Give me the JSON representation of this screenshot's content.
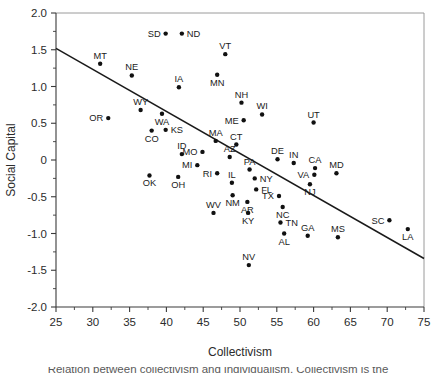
{
  "figure": {
    "background": "#ffffff",
    "dot_color": "#111111",
    "line_color": "#1a1a1a",
    "axis_color": "#3a3a3a",
    "frame_color": "#8e8e8e"
  },
  "caption": {
    "partial_text": "Relation between collectivism and individualism. Collectivism is the"
  },
  "chart_data": {
    "type": "scatter",
    "title": "",
    "xlabel": "Collectivism",
    "ylabel": "Social Capital",
    "xlim": [
      25,
      75
    ],
    "ylim": [
      -2.0,
      2.0
    ],
    "xticks": [
      25,
      30,
      35,
      40,
      45,
      50,
      55,
      60,
      65,
      70,
      75
    ],
    "xtick_labels": [
      "25",
      "30",
      "35",
      "40",
      "45",
      "50",
      "55",
      "60",
      "65",
      "70",
      "75"
    ],
    "yticks": [
      -2.0,
      -1.5,
      -1.0,
      -0.5,
      0,
      0.5,
      1.0,
      1.5,
      2.0
    ],
    "ytick_labels": [
      "-2.0",
      "-1.5",
      "-1.0",
      "-0.5",
      "0",
      "0.5",
      "1.0",
      "1.5",
      "2.0"
    ],
    "xminor_step": 2.5,
    "yminor_step": 0.25,
    "grid": false,
    "legend": "none",
    "point_label_field": "state",
    "trend_line": {
      "x_start": 25,
      "y_start": 1.52,
      "x_end": 75,
      "y_end": -1.34
    },
    "points": [
      {
        "state": "SD",
        "x": 39.9,
        "y": 1.72,
        "label_pos": "left"
      },
      {
        "state": "ND",
        "x": 42.1,
        "y": 1.72,
        "label_pos": "right"
      },
      {
        "state": "VT",
        "x": 48.0,
        "y": 1.44,
        "label_pos": "top"
      },
      {
        "state": "MT",
        "x": 31.0,
        "y": 1.31,
        "label_pos": "top"
      },
      {
        "state": "MN",
        "x": 46.9,
        "y": 1.16,
        "label_pos": "bottom"
      },
      {
        "state": "NE",
        "x": 35.3,
        "y": 1.15,
        "label_pos": "top"
      },
      {
        "state": "IA",
        "x": 41.7,
        "y": 0.99,
        "label_pos": "top"
      },
      {
        "state": "NH",
        "x": 50.2,
        "y": 0.78,
        "label_pos": "top"
      },
      {
        "state": "WY",
        "x": 36.5,
        "y": 0.68,
        "label_pos": "top"
      },
      {
        "state": "WI",
        "x": 53.0,
        "y": 0.62,
        "label_pos": "top"
      },
      {
        "state": "WA",
        "x": 39.4,
        "y": 0.63,
        "label_pos": "bottom"
      },
      {
        "state": "OR",
        "x": 32.1,
        "y": 0.57,
        "label_pos": "left"
      },
      {
        "state": "ME",
        "x": 50.5,
        "y": 0.54,
        "label_pos": "left"
      },
      {
        "state": "UT",
        "x": 60.0,
        "y": 0.51,
        "label_pos": "top"
      },
      {
        "state": "KS",
        "x": 39.9,
        "y": 0.41,
        "label_pos": "right"
      },
      {
        "state": "CO",
        "x": 38.0,
        "y": 0.4,
        "label_pos": "bottom"
      },
      {
        "state": "MA",
        "x": 46.7,
        "y": 0.26,
        "label_pos": "top"
      },
      {
        "state": "CT",
        "x": 49.5,
        "y": 0.21,
        "label_pos": "top"
      },
      {
        "state": "MO",
        "x": 44.9,
        "y": 0.11,
        "label_pos": "left"
      },
      {
        "state": "ID",
        "x": 42.1,
        "y": 0.08,
        "label_pos": "top"
      },
      {
        "state": "AZ",
        "x": 48.6,
        "y": 0.04,
        "label_pos": "top"
      },
      {
        "state": "DE",
        "x": 55.1,
        "y": 0.01,
        "label_pos": "top"
      },
      {
        "state": "MI",
        "x": 44.2,
        "y": -0.07,
        "label_pos": "left"
      },
      {
        "state": "IN",
        "x": 57.3,
        "y": -0.04,
        "label_pos": "top"
      },
      {
        "state": "CA",
        "x": 60.2,
        "y": -0.11,
        "label_pos": "top"
      },
      {
        "state": "PA",
        "x": 51.3,
        "y": -0.13,
        "label_pos": "top"
      },
      {
        "state": "MD",
        "x": 63.1,
        "y": -0.18,
        "label_pos": "top"
      },
      {
        "state": "RI",
        "x": 46.9,
        "y": -0.18,
        "label_pos": "left"
      },
      {
        "state": "VA",
        "x": 60.1,
        "y": -0.2,
        "label_pos": "left"
      },
      {
        "state": "OK",
        "x": 37.7,
        "y": -0.21,
        "label_pos": "bottom"
      },
      {
        "state": "OH",
        "x": 41.6,
        "y": -0.23,
        "label_pos": "bottom"
      },
      {
        "state": "NY",
        "x": 52.0,
        "y": -0.25,
        "label_pos": "right"
      },
      {
        "state": "IL",
        "x": 48.9,
        "y": -0.31,
        "label_pos": "top"
      },
      {
        "state": "NJ",
        "x": 59.5,
        "y": -0.33,
        "label_pos": "bottom"
      },
      {
        "state": "FL",
        "x": 52.2,
        "y": -0.4,
        "label_pos": "right"
      },
      {
        "state": "NM",
        "x": 49.0,
        "y": -0.48,
        "label_pos": "bottom"
      },
      {
        "state": "TX",
        "x": 55.3,
        "y": -0.49,
        "label_pos": "left"
      },
      {
        "state": "AR",
        "x": 51.0,
        "y": -0.57,
        "label_pos": "bottom"
      },
      {
        "state": "NC",
        "x": 55.8,
        "y": -0.64,
        "label_pos": "bottom"
      },
      {
        "state": "WV",
        "x": 46.4,
        "y": -0.72,
        "label_pos": "top"
      },
      {
        "state": "KY",
        "x": 51.1,
        "y": -0.72,
        "label_pos": "bottom"
      },
      {
        "state": "SC",
        "x": 70.3,
        "y": -0.82,
        "label_pos": "left"
      },
      {
        "state": "TN",
        "x": 55.5,
        "y": -0.85,
        "label_pos": "right"
      },
      {
        "state": "LA",
        "x": 72.8,
        "y": -0.94,
        "label_pos": "bottom"
      },
      {
        "state": "AL",
        "x": 56.0,
        "y": -1.0,
        "label_pos": "bottom"
      },
      {
        "state": "GA",
        "x": 59.2,
        "y": -1.03,
        "label_pos": "top"
      },
      {
        "state": "MS",
        "x": 63.3,
        "y": -1.05,
        "label_pos": "top"
      },
      {
        "state": "NV",
        "x": 51.2,
        "y": -1.43,
        "label_pos": "top"
      }
    ]
  }
}
